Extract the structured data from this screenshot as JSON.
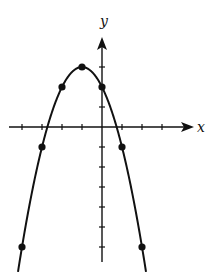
{
  "chart_data": {
    "type": "line",
    "title": "",
    "function": "y = -x^2 - 2x + 2",
    "xlabel": "x",
    "ylabel": "y",
    "xlim": [
      -4.5,
      4.5
    ],
    "ylim": [
      -6.7,
      4.5
    ],
    "grid": false,
    "legend": "none",
    "x_ticks": [
      -4,
      -3,
      -2,
      -1,
      1,
      2,
      3
    ],
    "y_ticks": [
      -6,
      -5,
      -4,
      -3,
      -2,
      -1,
      1,
      2,
      3
    ],
    "points": [
      {
        "x": -4,
        "y": -6
      },
      {
        "x": -3,
        "y": -1
      },
      {
        "x": -2,
        "y": 2
      },
      {
        "x": -1,
        "y": 3
      },
      {
        "x": 0,
        "y": 2
      },
      {
        "x": 1,
        "y": -1
      },
      {
        "x": 2,
        "y": -6
      }
    ],
    "curve_x_range": [
      -4.2,
      2.2
    ]
  },
  "labels": {
    "x_axis": "x",
    "y_axis": "y"
  },
  "colors": {
    "stroke": "#111111",
    "background": "#ffffff"
  }
}
